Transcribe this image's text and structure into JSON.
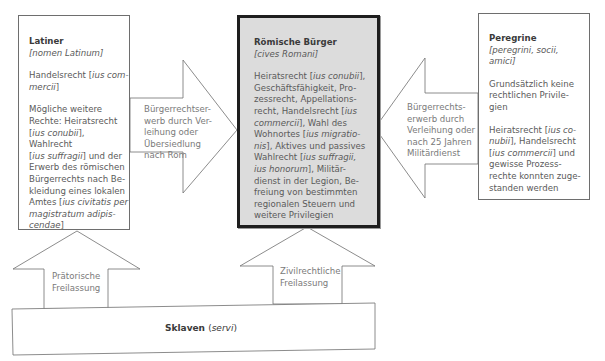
{
  "diagram": {
    "nodes": {
      "latiner": {
        "title": "Latiner",
        "subtitle": "[nomen Latinum]",
        "rights_1_pre": "Handelsrecht [",
        "rights_1_term": "ius commercii",
        "rights_1_post": "]",
        "rights_2": "Mögliche weitere Rechte: Heiratsrecht [ius conubii], Wahlrecht [ius suffragii] und der Erwerb des römischen Bürgerrechts nach Bekleidung eines lokalen Amtes [ius civitatis per magistratum adipiscendae]",
        "lines": [
          {
            "t": "Mögliche weitere"
          },
          {
            "t": "Rechte: Heiratsrecht"
          },
          {
            "pre": "[",
            "i": "ius conubii",
            "post": "], Wahlrecht"
          },
          {
            "pre": "[",
            "i": "ius suffragii",
            "post": "] und der"
          },
          {
            "t": "Erwerb des römischen"
          },
          {
            "t": "Bürgerrechts nach Be-"
          },
          {
            "t": "kleidung eines lokalen"
          },
          {
            "pre": "Amtes [",
            "i": "ius civitatis per",
            "post": ""
          },
          {
            "pre": "",
            "i": "magistratum adipis-",
            "post": ""
          },
          {
            "pre": "",
            "i": "cendae",
            "post": "]"
          }
        ]
      },
      "roemische_buerger": {
        "title": "Römische Bürger",
        "subtitle": "[cives Romani]",
        "lines": [
          {
            "pre": "Heiratsrecht [",
            "i": "ius conubii",
            "post": "],"
          },
          {
            "t": "Geschäftsfähigkeit, Pro-"
          },
          {
            "t": "zessrecht, Appellations-"
          },
          {
            "pre": "recht, Handelsrecht [",
            "i": "ius",
            "post": ""
          },
          {
            "pre": "",
            "i": "commercii",
            "post": "], Wahl des"
          },
          {
            "pre": "Wohnortes [",
            "i": "ius migratio-",
            "post": ""
          },
          {
            "pre": "",
            "i": "nis",
            "post": "], Aktives und passives"
          },
          {
            "pre": "Wahlrecht [",
            "i": "ius suffragii,",
            "post": ""
          },
          {
            "pre": "",
            "i": "ius honorum",
            "post": "], Militär-"
          },
          {
            "t": "dienst in der Legion, Be-"
          },
          {
            "t": "freiung von bestimmten"
          },
          {
            "t": "regionalen Steuern und"
          },
          {
            "t": "weitere Privilegien"
          }
        ]
      },
      "peregrine": {
        "title": "Peregrine",
        "subtitle_lines": [
          "[peregrini, socii,",
          "amici]"
        ],
        "lines_1": [
          "Grundsätzlich keine",
          "rechtlichen Privile-",
          "gien"
        ],
        "lines_2": [
          {
            "pre": "Heiratsrecht [",
            "i": "ius co-",
            "post": ""
          },
          {
            "pre": "",
            "i": "nubii",
            "post": "], Handelsrecht"
          },
          {
            "pre": "[",
            "i": "ius commercii",
            "post": "] und"
          },
          {
            "t": "gewisse Prozess-"
          },
          {
            "t": "rechte konnten zuge-"
          },
          {
            "t": "standen werden"
          }
        ]
      },
      "sklaven": {
        "title": "Sklaven",
        "subtitle": "(servi)"
      }
    },
    "arrows": {
      "latiner_to_buerger": [
        "Bürgerrechtser-",
        "werb durch Ver-",
        "leihung oder",
        "Übersiedlung",
        "nach Rom"
      ],
      "peregrine_to_buerger": [
        "Bürgerrechts-",
        "erwerb durch",
        "Verleihung oder",
        "nach 25 Jahren",
        "Militärdienst"
      ],
      "sklaven_to_latiner": [
        "Prätorische",
        "Freilassung"
      ],
      "sklaven_to_buerger": [
        "Zivilrechtliche",
        "Freilassung"
      ]
    },
    "colors": {
      "line": "#6e6e6e",
      "center_fill": "#dcdcdc",
      "center_border": "#1e1e1e",
      "text": "#5a5a5a"
    }
  }
}
